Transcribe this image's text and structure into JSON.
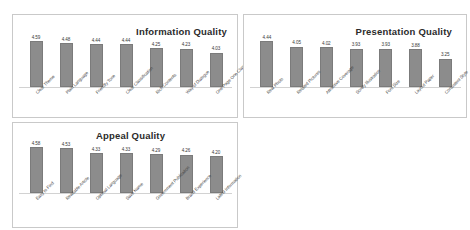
{
  "chart_data": [
    {
      "type": "bar",
      "title": "Information Quality",
      "categories": [
        "Clear Theme",
        "Plain Language",
        "Friendly Tone",
        "Clear Classification",
        "Rich Contents",
        "Way of Dialogue",
        "One Page One Class"
      ],
      "values": [
        4.59,
        4.48,
        4.44,
        4.44,
        4.25,
        4.23,
        4.03
      ],
      "value_labels": [
        "4.59",
        "4.48",
        "4.44",
        "4.44",
        "4.25",
        "4.23",
        "4.03"
      ],
      "xlabel": "",
      "ylabel": "",
      "ylim": [
        0,
        5
      ],
      "grid": false,
      "legend": "none",
      "bar_color": "#8c8c8c"
    },
    {
      "type": "bar",
      "title": "Presentation Quality",
      "categories": [
        "Real Photo",
        "Related Pictures",
        "Attractive Coverage",
        "Sorely Illustration",
        "Font Size",
        "Layout Paper",
        "Consistent Style"
      ],
      "values": [
        4.44,
        4.05,
        4.02,
        3.93,
        3.93,
        3.88,
        3.25
      ],
      "value_labels": [
        "4.44",
        "4.05",
        "4.02",
        "3.93",
        "3.93",
        "3.88",
        "3.25"
      ],
      "xlabel": "",
      "ylabel": "",
      "ylim": [
        0,
        5
      ],
      "grid": false,
      "legend": "none",
      "bar_color": "#8c8c8c"
    },
    {
      "type": "bar",
      "title": "Appeal Quality",
      "categories": [
        "Easy to Find",
        "Readable Article",
        "Optimal Language",
        "Save Name",
        "Government Publication",
        "Brand Experience",
        "Latest Information"
      ],
      "values": [
        4.58,
        4.53,
        4.33,
        4.33,
        4.29,
        4.26,
        4.2
      ],
      "value_labels": [
        "4.58",
        "4.53",
        "4.33",
        "4.33",
        "4.29",
        "4.26",
        "4.20"
      ],
      "xlabel": "",
      "ylabel": "",
      "ylim": [
        0,
        5
      ],
      "grid": false,
      "legend": "none",
      "bar_color": "#8c8c8c"
    }
  ],
  "panels": {
    "information": {
      "title": "Information Quality"
    },
    "presentation": {
      "title": "Presentation Quality"
    },
    "appeal": {
      "title": "Appeal Quality"
    }
  }
}
